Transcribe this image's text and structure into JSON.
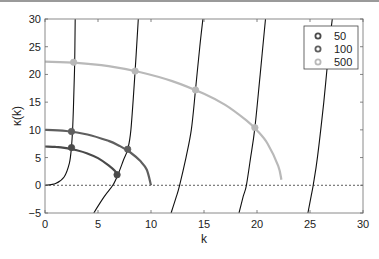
{
  "chart_data": {
    "type": "line",
    "title": "",
    "xlabel": "k",
    "ylabel": "κ(k)",
    "xlim": [
      0,
      30
    ],
    "ylim": [
      -5,
      30
    ],
    "xticks": [
      0,
      5,
      10,
      15,
      20,
      25,
      30
    ],
    "yticks": [
      -5,
      0,
      5,
      10,
      15,
      20,
      25,
      30
    ],
    "grid": false,
    "legend_position": "upper right",
    "zero_line": {
      "style": "dotted",
      "y": 0
    },
    "series": [
      {
        "name": "50",
        "color": "#4a4a4a",
        "curve": [
          [
            0,
            7.0
          ],
          [
            1,
            6.93
          ],
          [
            2,
            6.71
          ],
          [
            3,
            6.32
          ],
          [
            4,
            5.74
          ],
          [
            5,
            4.9
          ],
          [
            6,
            3.6
          ],
          [
            6.6,
            2.6
          ],
          [
            7.0,
            1.6
          ]
        ],
        "markers": [
          [
            2.5,
            6.8
          ],
          [
            6.8,
            1.9
          ]
        ]
      },
      {
        "name": "100",
        "color": "#5f5f5f",
        "curve": [
          [
            0,
            10.0
          ],
          [
            2,
            9.8
          ],
          [
            4,
            9.17
          ],
          [
            6,
            8.0
          ],
          [
            7,
            7.14
          ],
          [
            8,
            6.0
          ],
          [
            9,
            4.36
          ],
          [
            9.6,
            2.8
          ],
          [
            10,
            0.0
          ]
        ],
        "markers": [
          [
            2.5,
            9.7
          ],
          [
            7.8,
            6.5
          ]
        ]
      },
      {
        "name": "500",
        "color": "#b9b9b9",
        "curve": [
          [
            0,
            22.3
          ],
          [
            3,
            22.1
          ],
          [
            6,
            21.5
          ],
          [
            9,
            20.4
          ],
          [
            12,
            18.8
          ],
          [
            15,
            16.5
          ],
          [
            17,
            14.5
          ],
          [
            19,
            11.7
          ],
          [
            20,
            9.9
          ],
          [
            21,
            7.5
          ],
          [
            22,
            3.5
          ],
          [
            22.3,
            1.0
          ]
        ],
        "markers": [
          [
            2.7,
            22.2
          ],
          [
            8.5,
            20.6
          ],
          [
            14.2,
            17.2
          ],
          [
            19.8,
            10.4
          ]
        ]
      }
    ],
    "dispersion_curves": [
      {
        "name": "branch-1",
        "color": "#111111",
        "points": [
          [
            0,
            0
          ],
          [
            1.0,
            0.3
          ],
          [
            1.8,
            1.5
          ],
          [
            2.3,
            4.0
          ],
          [
            2.5,
            7.0
          ],
          [
            2.6,
            10
          ],
          [
            2.7,
            15
          ],
          [
            2.8,
            22.2
          ],
          [
            2.85,
            30
          ]
        ]
      },
      {
        "name": "branch-2",
        "color": "#111111",
        "points": [
          [
            4.6,
            -5
          ],
          [
            5.6,
            -2
          ],
          [
            6.4,
            0
          ],
          [
            6.9,
            2.0
          ],
          [
            7.4,
            4.5
          ],
          [
            7.8,
            6.5
          ],
          [
            8.1,
            10
          ],
          [
            8.5,
            20.6
          ],
          [
            8.8,
            30
          ]
        ]
      },
      {
        "name": "branch-3",
        "color": "#111111",
        "points": [
          [
            11.9,
            -5
          ],
          [
            12.4,
            -2
          ],
          [
            12.7,
            0
          ],
          [
            13.3,
            5
          ],
          [
            13.8,
            10
          ],
          [
            14.2,
            17.2
          ],
          [
            14.6,
            25
          ],
          [
            14.9,
            30
          ]
        ]
      },
      {
        "name": "branch-4",
        "color": "#111111",
        "points": [
          [
            18.3,
            -5
          ],
          [
            18.7,
            -2
          ],
          [
            19.0,
            0
          ],
          [
            19.4,
            5
          ],
          [
            19.8,
            10.4
          ],
          [
            20.3,
            20
          ],
          [
            20.8,
            30
          ]
        ]
      },
      {
        "name": "branch-5",
        "color": "#111111",
        "points": [
          [
            24.8,
            -5
          ],
          [
            25.1,
            -2
          ],
          [
            25.3,
            0
          ],
          [
            25.7,
            5
          ],
          [
            26.3,
            15
          ],
          [
            26.8,
            25
          ],
          [
            27.1,
            30
          ]
        ]
      }
    ],
    "legend": [
      {
        "label": "50",
        "color": "#4a4a4a"
      },
      {
        "label": "100",
        "color": "#5f5f5f"
      },
      {
        "label": "500",
        "color": "#b9b9b9"
      }
    ]
  },
  "labels": {
    "x_axis": "k",
    "y_axis": "κ(k)",
    "x_ticks": [
      "0",
      "5",
      "10",
      "15",
      "20",
      "25",
      "30"
    ],
    "y_ticks": [
      "−5",
      "0",
      "5",
      "10",
      "15",
      "20",
      "25",
      "30"
    ],
    "legend": [
      "50",
      "100",
      "500"
    ]
  }
}
